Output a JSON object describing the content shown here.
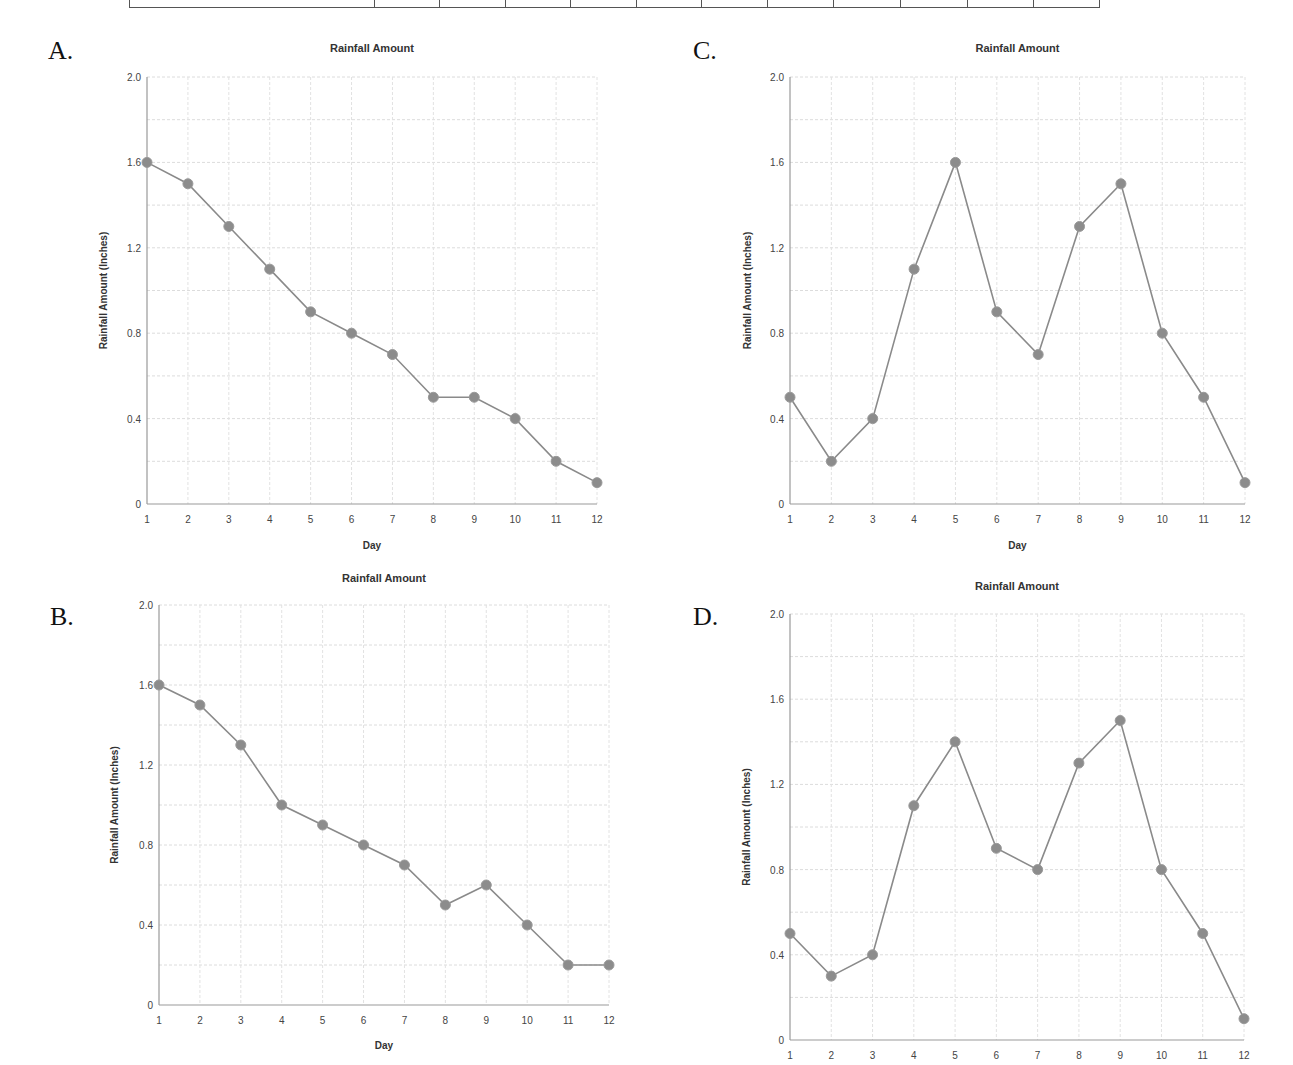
{
  "top_table": {
    "column_widths": [
      244,
      64,
      65,
      64,
      65,
      64,
      65,
      65,
      66,
      66,
      65,
      65
    ]
  },
  "panels": [
    {
      "letter": "A."
    },
    {
      "letter": "B."
    },
    {
      "letter": "C."
    },
    {
      "letter": "D."
    }
  ],
  "chart_data": [
    {
      "panel": "A",
      "type": "line",
      "title": "Rainfall Amount",
      "xlabel": "Day",
      "ylabel": "Rainfall Amount (Inches)",
      "x": [
        1,
        2,
        3,
        4,
        5,
        6,
        7,
        8,
        9,
        10,
        11,
        12
      ],
      "values": [
        1.6,
        1.5,
        1.3,
        1.1,
        0.9,
        0.8,
        0.7,
        0.5,
        0.5,
        0.4,
        0.2,
        0.1
      ],
      "yticks": [
        "0",
        "0.4",
        "0.8",
        "1.2",
        "1.6",
        "2.0"
      ],
      "ylim": [
        0,
        2.0
      ],
      "grid": true,
      "legend": "none"
    },
    {
      "panel": "B",
      "type": "line",
      "title": "Rainfall Amount",
      "xlabel": "Day",
      "ylabel": "Rainfall Amount (Inches)",
      "x": [
        1,
        2,
        3,
        4,
        5,
        6,
        7,
        8,
        9,
        10,
        11,
        12
      ],
      "values": [
        1.6,
        1.5,
        1.3,
        1.0,
        0.9,
        0.8,
        0.7,
        0.5,
        0.6,
        0.4,
        0.2,
        0.2
      ],
      "yticks": [
        "0",
        "0.4",
        "0.8",
        "1.2",
        "1.6",
        "2.0"
      ],
      "ylim": [
        0,
        2.0
      ],
      "grid": true,
      "legend": "none"
    },
    {
      "panel": "C",
      "type": "line",
      "title": "Rainfall Amount",
      "xlabel": "Day",
      "ylabel": "Rainfall Amount (Inches)",
      "x": [
        1,
        2,
        3,
        4,
        5,
        6,
        7,
        8,
        9,
        10,
        11,
        12
      ],
      "values": [
        0.5,
        0.2,
        0.4,
        1.1,
        1.6,
        0.9,
        0.7,
        1.3,
        1.5,
        0.8,
        0.5,
        0.1
      ],
      "yticks": [
        "0",
        "0.4",
        "0.8",
        "1.2",
        "1.6",
        "2.0"
      ],
      "ylim": [
        0,
        2.0
      ],
      "grid": true,
      "legend": "none"
    },
    {
      "panel": "D",
      "type": "line",
      "title": "Rainfall Amount",
      "xlabel": "",
      "ylabel": "Rainfall Amount (Inches)",
      "x": [
        1,
        2,
        3,
        4,
        5,
        6,
        7,
        8,
        9,
        10,
        11,
        12
      ],
      "values": [
        0.5,
        0.3,
        0.4,
        1.1,
        1.4,
        0.9,
        0.8,
        1.3,
        1.5,
        0.8,
        0.5,
        0.1
      ],
      "yticks": [
        "0",
        "0.4",
        "0.8",
        "1.2",
        "1.6",
        "2.0"
      ],
      "ylim": [
        0,
        2.0
      ],
      "grid": true,
      "legend": "none"
    }
  ]
}
